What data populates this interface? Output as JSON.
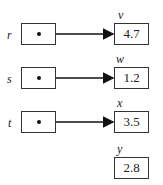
{
  "pointers": [
    {
      "name": "r",
      "target": "v"
    },
    {
      "name": "s",
      "target": "w"
    },
    {
      "name": "t",
      "target": "x"
    }
  ],
  "values": [
    {
      "name": "v",
      "value": "4.7"
    },
    {
      "name": "w",
      "value": "1.2"
    },
    {
      "name": "x",
      "value": "3.5"
    },
    {
      "name": "y",
      "value": "2.8"
    }
  ]
}
